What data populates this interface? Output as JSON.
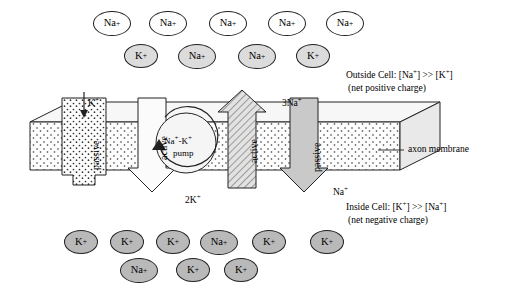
{
  "figure": {
    "membrane_label": "axon membrane",
    "outside_label_line1": "Outside Cell: [Na+] >> [K+]",
    "outside_label_line2": "(net positive charge)",
    "inside_label_line1": "Inside Cell: [K+] >> [Na+]",
    "inside_label_line2": "(net negative charge)"
  },
  "channels": [
    {
      "name": "passive-left",
      "label": "passive",
      "direction": "down",
      "ion": "K+"
    },
    {
      "name": "active-left",
      "label": "active",
      "direction": "down",
      "ion": "2K+"
    },
    {
      "name": "pump",
      "label": "Na+-K+ pump",
      "line1": "Na+-K+",
      "line2": "pump"
    },
    {
      "name": "active-right",
      "label": "active",
      "direction": "up",
      "ion": "3Na+"
    },
    {
      "name": "passive-right",
      "label": "passive",
      "direction": "down",
      "ion": "Na+"
    }
  ],
  "arrow_labels": [
    {
      "name": "k-in-left",
      "text": "K",
      "sup": "+",
      "x": 88,
      "y": 100
    },
    {
      "name": "three-na-out",
      "text": "3Na",
      "sup": "+",
      "x": 285,
      "y": 98
    },
    {
      "name": "two-k-in",
      "text": "2K",
      "sup": "+",
      "x": 188,
      "y": 198
    },
    {
      "name": "na-in-right",
      "text": "Na",
      "sup": "+",
      "x": 333,
      "y": 190
    }
  ],
  "outside_ions": [
    {
      "name": "na-out-1",
      "text": "Na",
      "sup": "+",
      "style": "white",
      "x": 93,
      "y": 11,
      "w": 38,
      "h": 25
    },
    {
      "name": "na-out-2",
      "text": "Na",
      "sup": "+",
      "style": "white",
      "x": 149,
      "y": 11,
      "w": 38,
      "h": 25
    },
    {
      "name": "na-out-3",
      "text": "Na",
      "sup": "+",
      "style": "white",
      "x": 209,
      "y": 11,
      "w": 38,
      "h": 25
    },
    {
      "name": "na-out-4",
      "text": "Na",
      "sup": "+",
      "style": "white",
      "x": 268,
      "y": 11,
      "w": 38,
      "h": 25
    },
    {
      "name": "na-out-5",
      "text": "Na",
      "sup": "+",
      "style": "white",
      "x": 326,
      "y": 11,
      "w": 38,
      "h": 25
    },
    {
      "name": "k-out-1",
      "text": "K",
      "sup": "+",
      "style": "light",
      "x": 124,
      "y": 44,
      "w": 34,
      "h": 24
    },
    {
      "name": "na-out-6",
      "text": "Na",
      "sup": "+",
      "style": "light",
      "x": 178,
      "y": 44,
      "w": 38,
      "h": 25
    },
    {
      "name": "na-out-7",
      "text": "Na",
      "sup": "+",
      "style": "light",
      "x": 238,
      "y": 44,
      "w": 38,
      "h": 25
    },
    {
      "name": "k-out-2",
      "text": "K",
      "sup": "+",
      "style": "light",
      "x": 296,
      "y": 44,
      "w": 34,
      "h": 24
    }
  ],
  "inside_ions": [
    {
      "name": "k-in-1",
      "text": "K",
      "sup": "+",
      "style": "gray",
      "x": 64,
      "y": 230,
      "w": 34,
      "h": 24
    },
    {
      "name": "k-in-2",
      "text": "K",
      "sup": "+",
      "style": "gray",
      "x": 110,
      "y": 230,
      "w": 34,
      "h": 24
    },
    {
      "name": "k-in-3",
      "text": "K",
      "sup": "+",
      "style": "gray",
      "x": 156,
      "y": 230,
      "w": 34,
      "h": 24
    },
    {
      "name": "na-in-1",
      "text": "Na",
      "sup": "+",
      "style": "gray",
      "x": 200,
      "y": 230,
      "w": 38,
      "h": 25
    },
    {
      "name": "k-in-4",
      "text": "K",
      "sup": "+",
      "style": "gray",
      "x": 252,
      "y": 230,
      "w": 34,
      "h": 24
    },
    {
      "name": "k-in-5",
      "text": "K",
      "sup": "+",
      "style": "gray",
      "x": 310,
      "y": 230,
      "w": 34,
      "h": 24
    },
    {
      "name": "na-in-2",
      "text": "Na",
      "sup": "+",
      "style": "gray",
      "x": 120,
      "y": 258,
      "w": 38,
      "h": 25
    },
    {
      "name": "k-in-6",
      "text": "K",
      "sup": "+",
      "style": "gray",
      "x": 176,
      "y": 258,
      "w": 34,
      "h": 24
    },
    {
      "name": "k-in-7",
      "text": "K",
      "sup": "+",
      "style": "gray",
      "x": 224,
      "y": 258,
      "w": 34,
      "h": 24
    }
  ],
  "colors": {
    "outline": "#222222",
    "membrane_fill": "#fbfbfb",
    "channel_fill": "#f2f2f2",
    "active_fill": "#cfcfcf",
    "ion_white": "#ffffff",
    "ion_light": "#dcdcdc",
    "ion_gray": "#b9b9b9"
  }
}
